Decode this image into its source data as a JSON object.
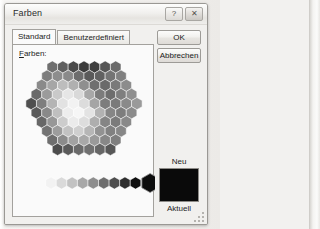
{
  "window": {
    "title": "Farben",
    "controls": [
      {
        "name": "help-button",
        "glyph": "?"
      },
      {
        "name": "close-button",
        "glyph": "✕"
      }
    ]
  },
  "tabs": [
    {
      "label": "Standard",
      "selected": true
    },
    {
      "label": "Benutzerdefiniert",
      "selected": false
    }
  ],
  "panel": {
    "label_prefix": "F",
    "label_rest": "arben:"
  },
  "buttons": {
    "ok": "OK",
    "cancel": "Abbrechen"
  },
  "preview": {
    "new_label": "Neu",
    "current_label": "Aktuell",
    "color": "#0a0a0a"
  },
  "palette": {
    "description": "grayscale hexagonal honeycomb color picker",
    "rows": [
      [
        "#6f6f6f",
        "#5f5f5f",
        "#4a4a4a",
        "#3b3b3b",
        "#3f3f3f",
        "#555555",
        "#6b6b6b"
      ],
      [
        "#7d7d7d",
        "#8d8d8d",
        "#8a8a8a",
        "#6d6d6d",
        "#5a5a5a",
        "#616161",
        "#747474",
        "#808080"
      ],
      [
        "#8a8a8a",
        "#a6a6a6",
        "#bdbdbd",
        "#b0b0b0",
        "#8f8f8f",
        "#6f6f6f",
        "#6a6a6a",
        "#7a7a7a",
        "#8c8c8c"
      ],
      [
        "#6a6a6a",
        "#9b9b9b",
        "#c9c9c9",
        "#e6e6e6",
        "#d9d9d9",
        "#a8a8a8",
        "#7c7c7c",
        "#6e6e6e",
        "#7f7f7f",
        "#909090"
      ],
      [
        "#4f4f4f",
        "#7e7e7e",
        "#b4b4b4",
        "#e2e2e2",
        "#f2f2f2",
        "#dcdcdc",
        "#a5a5a5",
        "#7d7d7d",
        "#7a7a7a",
        "#8a8a8a",
        "#9a9a9a"
      ],
      [
        "#5a5a5a",
        "#898989",
        "#bfbfbf",
        "#ededed",
        "#f6f6f6",
        "#e3e3e3",
        "#b2b2b2",
        "#868686",
        "#7d7d7d",
        "#8b8b8b"
      ],
      [
        "#676767",
        "#979797",
        "#cccccc",
        "#ebebeb",
        "#dddddd",
        "#aeaeae",
        "#858585",
        "#7b7b7b",
        "#898989"
      ],
      [
        "#737373",
        "#9d9d9d",
        "#c2c2c2",
        "#cfcfcf",
        "#b6b6b6",
        "#929292",
        "#818181",
        "#878787"
      ],
      [
        "#6e6e6e",
        "#8b8b8b",
        "#a2a2a2",
        "#a8a8a8",
        "#9a9a9a",
        "#878787",
        "#7f7f7f"
      ],
      [
        "#4c4c4c",
        "#5a5a5a",
        "#6a6a6a",
        "#707070",
        "#666666",
        "#575757"
      ]
    ],
    "gray_ramp": [
      "#f2f2f2",
      "#dadada",
      "#c2c2c2",
      "#a8a8a8",
      "#8e8e8e",
      "#6e6e6e",
      "#4e4e4e",
      "#2e2e2e",
      "#101010"
    ],
    "selected_color": "#0d0d0d"
  }
}
